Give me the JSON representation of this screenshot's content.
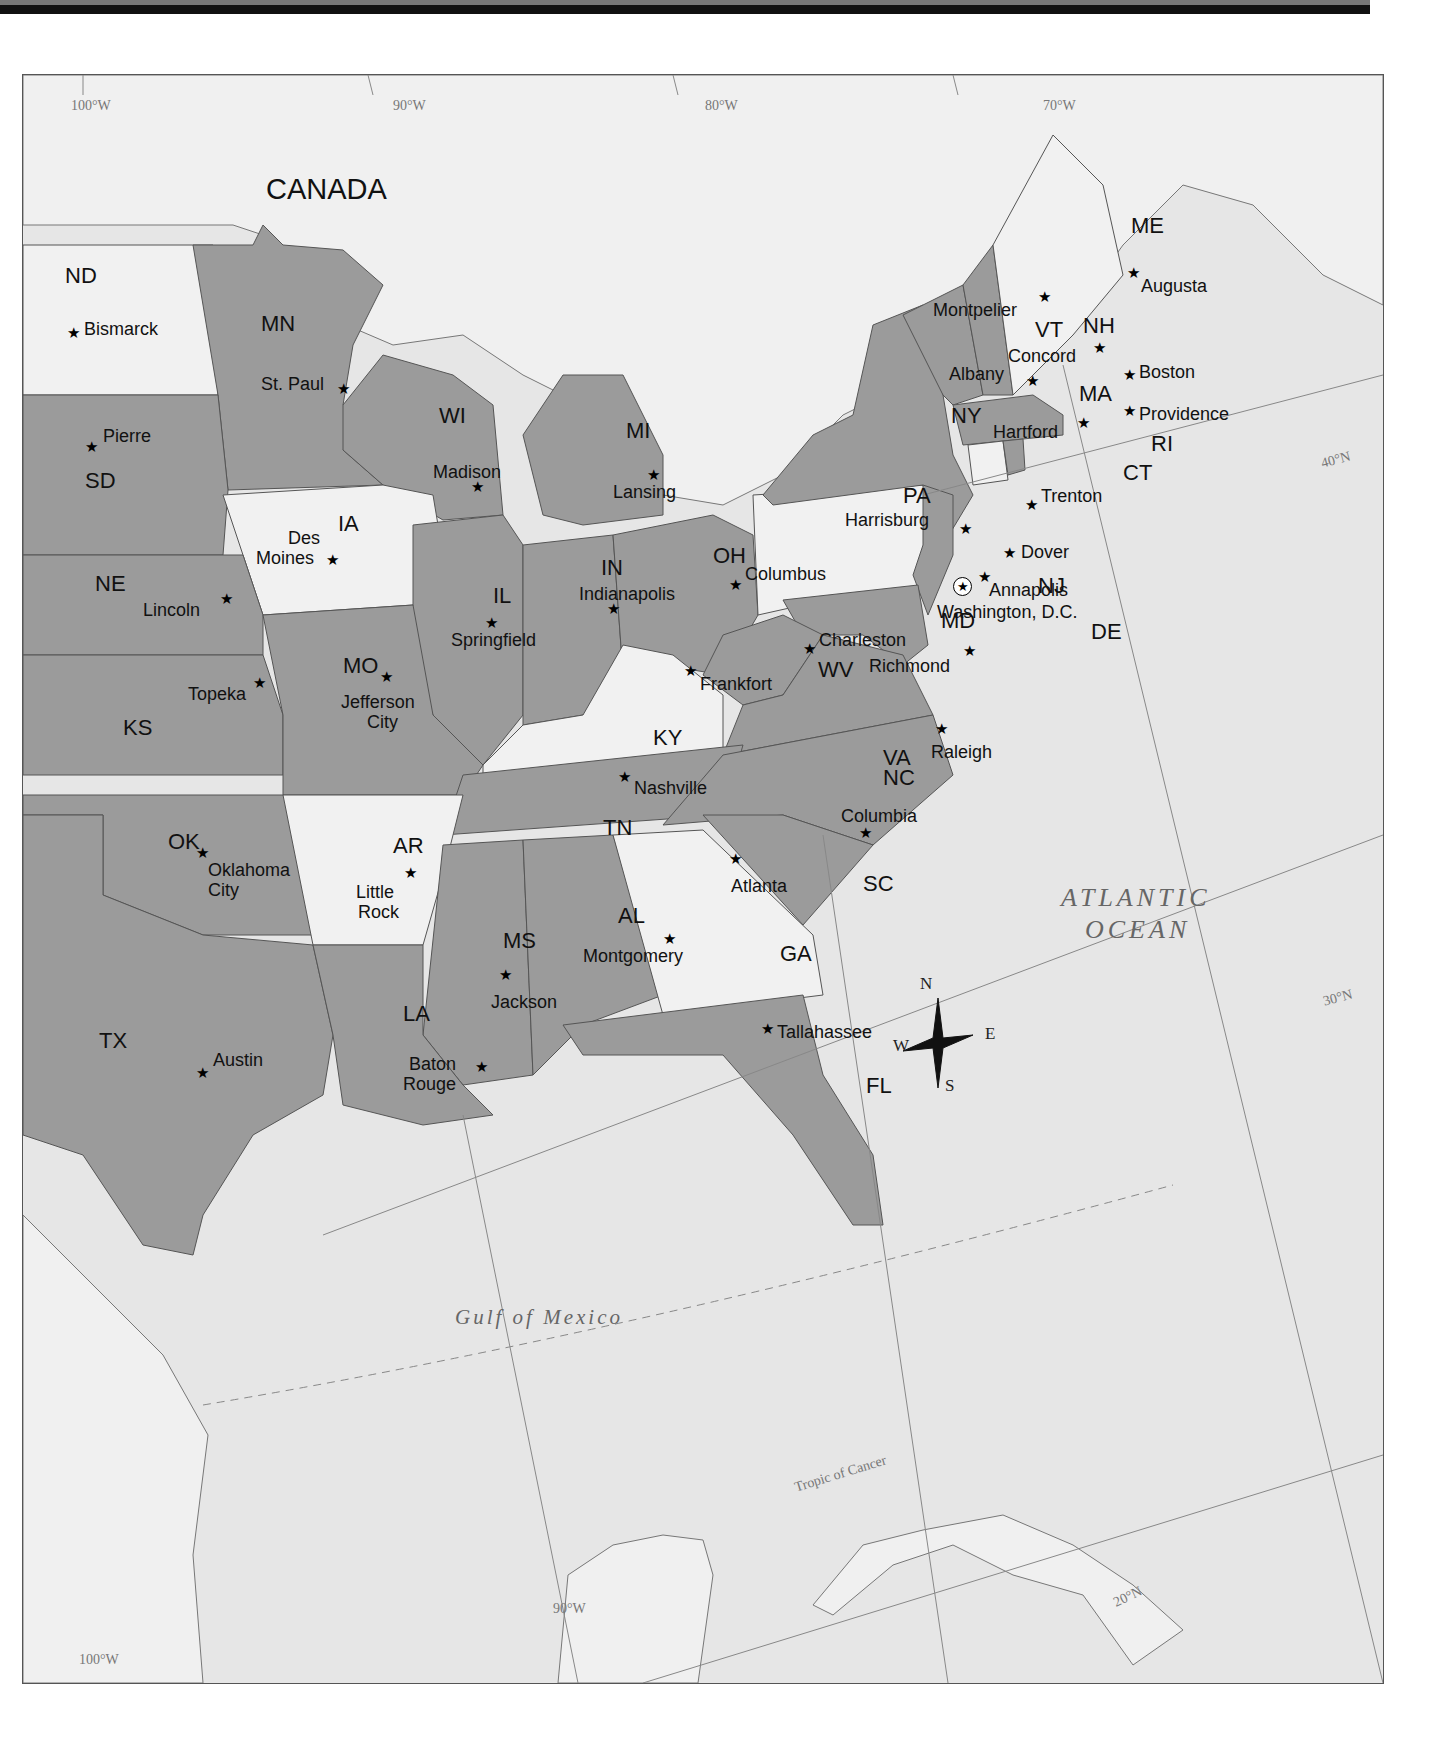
{
  "map": {
    "title_region": "Eastern United States",
    "country_label": "CANADA",
    "water_bodies": {
      "atlantic_line1": "ATLANTIC",
      "atlantic_line2": "OCEAN",
      "gulf": "Gulf of Mexico"
    },
    "lines": {
      "tropic": "Tropic of Cancer"
    },
    "longitudes": [
      "100°W",
      "90°W",
      "80°W",
      "70°W"
    ],
    "latitudes": [
      "40°N",
      "30°N",
      "20°N"
    ],
    "bottom_longitudes": [
      "90°W",
      "100°W"
    ],
    "compass": {
      "n": "N",
      "e": "E",
      "s": "S",
      "w": "W"
    },
    "colors": {
      "dark_state": "#9b9b9b",
      "light_state": "#f1f1f1",
      "water": "#e6e6e6",
      "border": "#555555"
    },
    "states": [
      {
        "abbr": "ND",
        "capital": "Bismarck",
        "shade": "light"
      },
      {
        "abbr": "MN",
        "capital": "St. Paul",
        "shade": "dark"
      },
      {
        "abbr": "SD",
        "capital": "Pierre",
        "shade": "dark"
      },
      {
        "abbr": "WI",
        "capital": "Madison",
        "shade": "dark"
      },
      {
        "abbr": "MI",
        "capital": "Lansing",
        "shade": "dark"
      },
      {
        "abbr": "IA",
        "capital": "Des Moines",
        "shade": "light"
      },
      {
        "abbr": "NE",
        "capital": "Lincoln",
        "shade": "dark"
      },
      {
        "abbr": "IL",
        "capital": "Springfield",
        "shade": "dark"
      },
      {
        "abbr": "IN",
        "capital": "Indianapolis",
        "shade": "dark"
      },
      {
        "abbr": "OH",
        "capital": "Columbus",
        "shade": "dark"
      },
      {
        "abbr": "PA",
        "capital": "Harrisburg",
        "shade": "light"
      },
      {
        "abbr": "NY",
        "capital": "Albany",
        "shade": "dark"
      },
      {
        "abbr": "VT",
        "capital": "Montpelier",
        "shade": "dark"
      },
      {
        "abbr": "NH",
        "capital": "Concord",
        "shade": "dark"
      },
      {
        "abbr": "ME",
        "capital": "Augusta",
        "shade": "light"
      },
      {
        "abbr": "MA",
        "capital": "Boston",
        "shade": "dark"
      },
      {
        "abbr": "RI",
        "capital": "Providence",
        "shade": "dark"
      },
      {
        "abbr": "CT",
        "capital": "Hartford",
        "shade": "light"
      },
      {
        "abbr": "NJ",
        "capital": "Trenton",
        "shade": "dark"
      },
      {
        "abbr": "DE",
        "capital": "Dover",
        "shade": "dark"
      },
      {
        "abbr": "MD",
        "capital": "Annapolis",
        "shade": "dark"
      },
      {
        "abbr": "DC",
        "capital": "Washington, D.C.",
        "shade": "light"
      },
      {
        "abbr": "WV",
        "capital": "Charleston",
        "shade": "dark"
      },
      {
        "abbr": "VA",
        "capital": "Richmond",
        "shade": "dark"
      },
      {
        "abbr": "KS",
        "capital": "Topeka",
        "shade": "dark"
      },
      {
        "abbr": "MO",
        "capital": "Jefferson City",
        "shade": "dark"
      },
      {
        "abbr": "KY",
        "capital": "Frankfort",
        "shade": "light"
      },
      {
        "abbr": "TN",
        "capital": "Nashville",
        "shade": "dark"
      },
      {
        "abbr": "NC",
        "capital": "Raleigh",
        "shade": "dark"
      },
      {
        "abbr": "OK",
        "capital": "Oklahoma City",
        "shade": "dark"
      },
      {
        "abbr": "AR",
        "capital": "Little Rock",
        "shade": "light"
      },
      {
        "abbr": "MS",
        "capital": "Jackson",
        "shade": "dark"
      },
      {
        "abbr": "AL",
        "capital": "Montgomery",
        "shade": "dark"
      },
      {
        "abbr": "GA",
        "capital": "Atlanta",
        "shade": "light"
      },
      {
        "abbr": "SC",
        "capital": "Columbia",
        "shade": "dark"
      },
      {
        "abbr": "TX",
        "capital": "Austin",
        "shade": "dark"
      },
      {
        "abbr": "LA",
        "capital": "Baton Rouge",
        "shade": "dark"
      },
      {
        "abbr": "FL",
        "capital": "Tallahassee",
        "shade": "dark"
      }
    ],
    "capital_labels": {
      "des_moines_1": "Des",
      "des_moines_2": "Moines",
      "jefferson_1": "Jefferson",
      "jefferson_2": "City",
      "okc_1": "Oklahoma",
      "okc_2": "City",
      "little_rock_1": "Little",
      "little_rock_2": "Rock",
      "baton_rouge_1": "Baton",
      "baton_rouge_2": "Rouge"
    }
  }
}
